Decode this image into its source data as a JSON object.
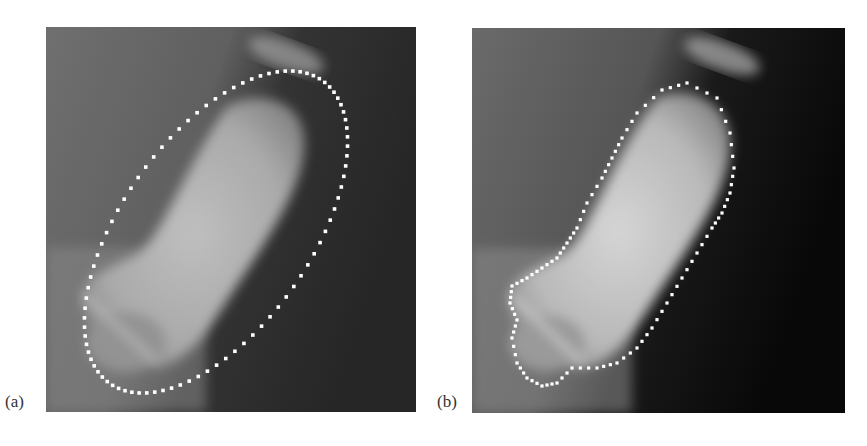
{
  "figure": {
    "panels": [
      {
        "id": "a",
        "label": "(a)",
        "description": "X-ray of finger bone with elliptical dotted initial contour"
      },
      {
        "id": "b",
        "label": "(b)",
        "description": "X-ray of finger bone with dotted contour fitted to bone boundary"
      }
    ],
    "colors": {
      "background": "#ffffff",
      "contour_dots": "#ffffff",
      "xray_dark": "#0a0a0a",
      "xray_tissue": "#6e6e6e",
      "xray_bone": "#d8d8d8"
    }
  }
}
